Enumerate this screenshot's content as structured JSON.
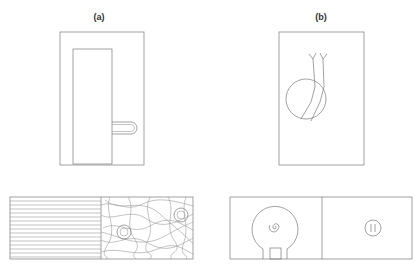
{
  "figure": {
    "panels": [
      {
        "id": "a",
        "label": "(a)",
        "top_view": "Rectangular enclosure with an inner tall rectangle and a U-shaped loop protruding to the right",
        "bottom_view": "Split rectangle: left half with horizontal parallel lines, right half with tangled fibers and two small circular cells"
      },
      {
        "id": "b",
        "label": "(b)",
        "top_view": "Rectangular enclosure with a circle crossed by two bent wires ending in forked tips",
        "bottom_view": "Split rectangle: left half with a bulb-shaped outline containing a spiral, right half with a small circle containing two vertical marks"
      }
    ],
    "colors": {
      "line": "#8a8a8a",
      "text": "#333333",
      "background": "#ffffff"
    }
  }
}
